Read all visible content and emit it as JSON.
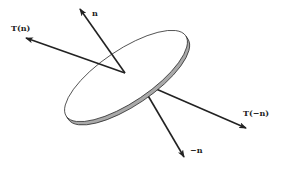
{
  "diagram": {
    "title": "",
    "labels": {
      "normal": "n",
      "traction_normal": "T(n)",
      "traction_negative": "T(−n)",
      "negative_normal": "−n"
    },
    "colors": {
      "stroke": "#222222",
      "disk_edge_fill": "#a9a9a9",
      "disk_face_fill": "#ffffff",
      "background": "#ffffff"
    }
  }
}
